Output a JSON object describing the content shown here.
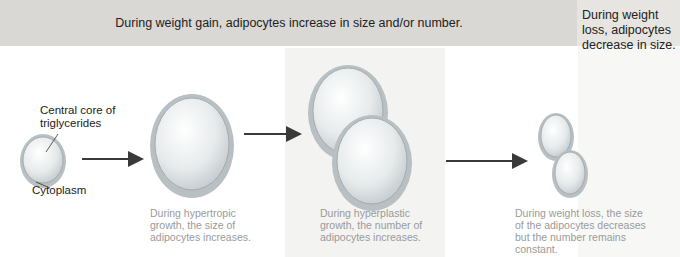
{
  "header": {
    "gain": "During weight gain, adipocytes increase in size and/or number.",
    "loss_line1": "During weight loss, adipocytes",
    "loss_line2": "decrease in size."
  },
  "labels": {
    "core_line1": "Central core of",
    "core_line2": "triglycerides",
    "cytoplasm": "Cytoplasm"
  },
  "captions": {
    "hypertrophic": [
      "During hypertropic",
      "growth, the size of",
      "adipocytes increases."
    ],
    "hyperplastic": [
      "During hyperplastic",
      "growth, the number of",
      "adipocytes increases."
    ],
    "loss": [
      "During weight loss, the size",
      "of the adipocytes decreases",
      "but the number remains",
      "constant."
    ]
  },
  "colors": {
    "header_gain_bg": "#d9d8d4",
    "header_loss_bg": "#e6e5e1",
    "cell_fill": "#e8ebec",
    "cell_rim": "#b5bcbf",
    "arrow": "#3a3a3a",
    "caption_text": "#9a9a9a"
  }
}
